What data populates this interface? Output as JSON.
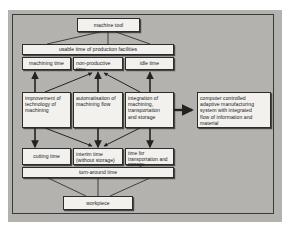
{
  "figure": {
    "type": "block-flow-diagram",
    "title_visible": false,
    "background_color": "#b8b6b2",
    "box_fill_color": "#f2f1ee",
    "line_color": "#2c2c2a"
  },
  "nodes": {
    "machine_tool": "machine tool",
    "usable_time": "usable time of production facilities",
    "machining_time": "machining time",
    "non_productive_time": "non-productive\ntime",
    "idle_time": "idle time",
    "improvement": "improvement of\ntechnology of\nmachining",
    "automatisation": "automatisation of\nmachining flow",
    "integration": "integration of\nmachining,\ntransportation\nand storage",
    "computer_system": "computer controlled\nadaptive manufacturing\nsystem with integrated\nflow of information and\nmaterial",
    "cutting_time": "cutting time",
    "interim_time": "interim time\n(without storage)",
    "transportation_time": "time for\ntransportation and\nstorage",
    "turn_around_time": "turn-around time",
    "workpiece": "workpiece"
  },
  "edges": [
    {
      "from": "machine_tool",
      "to": "machining_time"
    },
    {
      "from": "machine_tool",
      "to": "non_productive_time"
    },
    {
      "from": "machine_tool",
      "to": "idle_time"
    },
    {
      "from": "improvement",
      "to": "machining_time"
    },
    {
      "from": "improvement",
      "to": "non_productive_time"
    },
    {
      "from": "automatisation",
      "to": "non_productive_time"
    },
    {
      "from": "integration",
      "to": "non_productive_time"
    },
    {
      "from": "integration",
      "to": "idle_time"
    },
    {
      "from": "improvement",
      "to": "cutting_time"
    },
    {
      "from": "improvement",
      "to": "interim_time"
    },
    {
      "from": "automatisation",
      "to": "interim_time"
    },
    {
      "from": "integration",
      "to": "interim_time"
    },
    {
      "from": "integration",
      "to": "transportation_time"
    },
    {
      "from": "integration",
      "to": "computer_system"
    },
    {
      "from": "turn_around_time",
      "to": "workpiece"
    }
  ]
}
